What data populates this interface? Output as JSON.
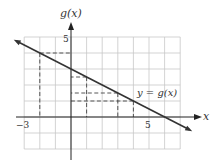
{
  "axes": {
    "y_label": "g(x)",
    "x_label": "x",
    "x_tick_labels": [
      {
        "value": -3,
        "text": "−3"
      },
      {
        "value": 5,
        "text": "5"
      }
    ],
    "y_tick_labels": [
      {
        "value": 5,
        "text": "5"
      }
    ],
    "xlim": [
      -3,
      7
    ],
    "ylim": [
      -2,
      5
    ]
  },
  "curve_label": "y = g(x)",
  "function": "g(x) = 3 - x/2",
  "dashed_guides": [
    {
      "x": -2,
      "y": 4
    },
    {
      "x": 1,
      "y": 2.5
    },
    {
      "x": 3,
      "y": 1.5
    },
    {
      "x": 4,
      "y": 1
    }
  ],
  "colors": {
    "grid": "#c8c8c8",
    "axis": "#222222",
    "line": "#333333"
  }
}
